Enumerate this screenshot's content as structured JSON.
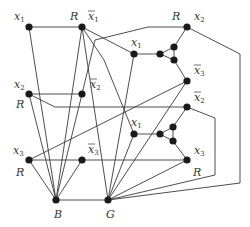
{
  "diagram": {
    "type": "graph reduction gadget (3-coloring)",
    "colors": {
      "edge": "#3a3a3a",
      "node": "#1a1a1a",
      "label": "#333333",
      "background": "#ffffff"
    },
    "nodes": [
      {
        "id": "x1L",
        "x": 29,
        "y": 27,
        "label": "x",
        "sub": "1",
        "bar": false,
        "lx": 14,
        "ly": 20
      },
      {
        "id": "nx1L",
        "x": 82,
        "y": 27,
        "label": "x",
        "sub": "1",
        "bar": true,
        "lx": 88,
        "ly": 20
      },
      {
        "id": "x2L",
        "x": 29,
        "y": 94,
        "label": "x",
        "sub": "2",
        "bar": false,
        "lx": 14,
        "ly": 88
      },
      {
        "id": "nx2L",
        "x": 82,
        "y": 94,
        "label": "x",
        "sub": "2",
        "bar": true,
        "lx": 90,
        "ly": 88
      },
      {
        "id": "x3L",
        "x": 29,
        "y": 160,
        "label": "x",
        "sub": "3",
        "bar": false,
        "lx": 13,
        "ly": 154
      },
      {
        "id": "nx3L",
        "x": 82,
        "y": 160,
        "label": "x",
        "sub": "3",
        "bar": true,
        "lx": 88,
        "ly": 153
      },
      {
        "id": "B",
        "x": 56,
        "y": 200,
        "label": "B",
        "lx": 54,
        "ly": 218
      },
      {
        "id": "G",
        "x": 108,
        "y": 200,
        "label": "G",
        "lx": 106,
        "ly": 218
      },
      {
        "id": "x2R",
        "x": 187,
        "y": 27,
        "label": "x",
        "sub": "2",
        "bar": false,
        "lx": 194,
        "ly": 20
      },
      {
        "id": "g1a",
        "x": 134,
        "y": 54,
        "label": "x",
        "sub": "1",
        "bar": false,
        "lx": 131,
        "ly": 46
      },
      {
        "id": "g1b",
        "x": 160,
        "y": 54
      },
      {
        "id": "g1c",
        "x": 174,
        "y": 47
      },
      {
        "id": "g1d",
        "x": 174,
        "y": 60
      },
      {
        "id": "nx3R",
        "x": 187,
        "y": 81,
        "label": "x",
        "sub": "3",
        "bar": true,
        "lx": 194,
        "ly": 74
      },
      {
        "id": "nx2R",
        "x": 187,
        "y": 107,
        "label": "x",
        "sub": "2",
        "bar": true,
        "lx": 194,
        "ly": 101
      },
      {
        "id": "g2a",
        "x": 134,
        "y": 134,
        "label": "x",
        "sub": "1",
        "bar": false,
        "lx": 131,
        "ly": 126
      },
      {
        "id": "g2b",
        "x": 160,
        "y": 134
      },
      {
        "id": "g2c",
        "x": 173,
        "y": 127
      },
      {
        "id": "g2d",
        "x": 173,
        "y": 141
      },
      {
        "id": "x3R",
        "x": 187,
        "y": 160,
        "label": "x",
        "sub": "3",
        "bar": false,
        "lx": 194,
        "ly": 154
      }
    ],
    "r_labels": [
      {
        "text": "R",
        "x": 70,
        "y": 20
      },
      {
        "text": "R",
        "x": 16,
        "y": 108
      },
      {
        "text": "R",
        "x": 16,
        "y": 176
      },
      {
        "text": "R",
        "x": 172,
        "y": 20
      },
      {
        "text": "R",
        "x": 193,
        "y": 176
      }
    ],
    "edges": [
      [
        [
          29,
          27
        ],
        [
          82,
          27
        ]
      ],
      [
        [
          29,
          94
        ],
        [
          82,
          94
        ]
      ],
      [
        [
          29,
          160
        ],
        [
          187,
          160
        ]
      ],
      [
        [
          56,
          200
        ],
        [
          108,
          200
        ]
      ],
      [
        [
          29,
          27
        ],
        [
          56,
          200
        ]
      ],
      [
        [
          82,
          27
        ],
        [
          56,
          200
        ]
      ],
      [
        [
          29,
          94
        ],
        [
          56,
          200
        ]
      ],
      [
        [
          82,
          94
        ],
        [
          56,
          200
        ]
      ],
      [
        [
          29,
          160
        ],
        [
          56,
          200
        ]
      ],
      [
        [
          82,
          160
        ],
        [
          56,
          200
        ]
      ],
      [
        [
          82,
          27
        ],
        [
          134,
          54
        ]
      ],
      [
        [
          82,
          27
        ],
        [
          108,
          200
        ]
      ],
      [
        [
          134,
          54
        ],
        [
          108,
          200
        ]
      ],
      [
        [
          134,
          54
        ],
        [
          160,
          54
        ]
      ],
      [
        [
          160,
          54
        ],
        [
          174,
          47
        ]
      ],
      [
        [
          160,
          54
        ],
        [
          174,
          60
        ]
      ],
      [
        [
          174,
          47
        ],
        [
          174,
          60
        ]
      ],
      [
        [
          174,
          47
        ],
        [
          187,
          27
        ]
      ],
      [
        [
          174,
          60
        ],
        [
          187,
          81
        ]
      ],
      [
        [
          187,
          81
        ],
        [
          108,
          200
        ]
      ],
      [
        [
          29,
          160
        ],
        [
          187,
          81
        ]
      ],
      [
        [
          134,
          134
        ],
        [
          108,
          200
        ]
      ],
      [
        [
          134,
          134
        ],
        [
          160,
          134
        ]
      ],
      [
        [
          160,
          134
        ],
        [
          173,
          127
        ]
      ],
      [
        [
          160,
          134
        ],
        [
          173,
          141
        ]
      ],
      [
        [
          173,
          127
        ],
        [
          173,
          141
        ]
      ],
      [
        [
          173,
          127
        ],
        [
          187,
          107
        ]
      ],
      [
        [
          173,
          141
        ],
        [
          187,
          160
        ]
      ],
      [
        [
          187,
          160
        ],
        [
          108,
          200
        ]
      ],
      [
        [
          29,
          94
        ],
        [
          55,
          107
        ],
        [
          187,
          107
        ]
      ],
      [
        [
          82,
          94
        ],
        [
          95,
          40
        ],
        [
          148,
          27
        ],
        [
          187,
          27
        ]
      ],
      [
        [
          82,
          27
        ],
        [
          104,
          60
        ],
        [
          134,
          134
        ]
      ],
      [
        [
          187,
          27
        ],
        [
          240,
          54
        ],
        [
          240,
          183
        ],
        [
          108,
          200
        ]
      ],
      [
        [
          187,
          107
        ],
        [
          215,
          118
        ],
        [
          215,
          175
        ],
        [
          108,
          200
        ]
      ]
    ]
  }
}
